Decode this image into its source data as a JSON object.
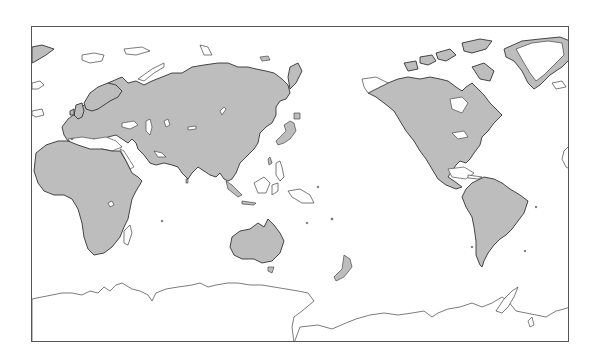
{
  "map": {
    "type": "world-outline-map",
    "projection": "equirectangular, Pacific-centered",
    "colors": {
      "land_fill": "#bdbdbd",
      "coastline": "#333333",
      "ocean": "#ffffff",
      "ice_sheet_fill": "#ffffff",
      "frame": "#555555"
    },
    "regions_shown": [
      "Europe",
      "Asia",
      "Africa",
      "Australia",
      "New Zealand",
      "North America",
      "South America",
      "Greenland",
      "Antarctica",
      "Southeast Asia archipelago",
      "Japan",
      "Madagascar"
    ],
    "labels": []
  }
}
